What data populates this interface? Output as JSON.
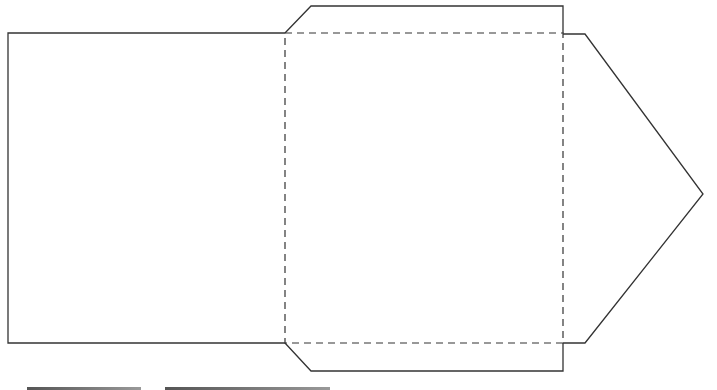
{
  "diagram": {
    "title": "",
    "type": "envelope-template",
    "stroke_color": "#333333",
    "fold_line_style": "dashed",
    "panels": {
      "left_panel": {
        "x": 8,
        "y": 33,
        "w": 276,
        "h": 310
      },
      "center_panel": {
        "x": 285,
        "y": 33,
        "w": 278,
        "h": 310
      },
      "top_flap": [
        [
          285,
          33
        ],
        [
          311,
          6
        ],
        [
          563,
          6
        ],
        [
          563,
          33
        ]
      ],
      "bottom_flap": [
        [
          285,
          343
        ],
        [
          311,
          371
        ],
        [
          563,
          371
        ],
        [
          563,
          343
        ]
      ],
      "right_flap": [
        [
          563,
          34
        ],
        [
          585,
          34
        ],
        [
          703,
          194
        ],
        [
          585,
          343
        ],
        [
          563,
          343
        ]
      ]
    },
    "bottom_bars": [
      {
        "x": 27,
        "w": 114
      },
      {
        "x": 165,
        "w": 165
      }
    ]
  }
}
